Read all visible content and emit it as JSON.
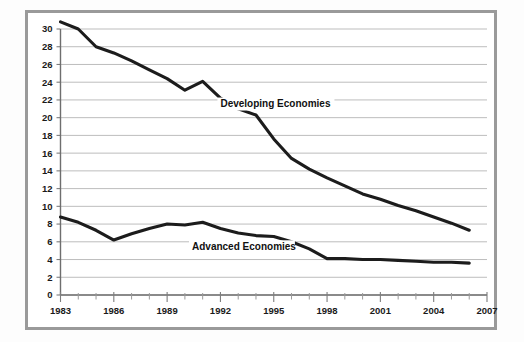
{
  "figure": {
    "background_color": "#ffffff",
    "frame_color": "#9a9a9a",
    "line_color": "#1c1c1c",
    "grid_color": "#bdbdbd"
  },
  "chart_data": {
    "type": "line",
    "title": "",
    "subtitle": "",
    "xlabel": "",
    "ylabel": "",
    "xlim": [
      1983,
      2007
    ],
    "ylim": [
      0,
      30
    ],
    "grid": "horizontal",
    "legend_position": "inline-annotations",
    "x_tick_step": 1,
    "x_label_step": 3,
    "y_tick_step": 2,
    "xticklabels": [
      "1983",
      "1986",
      "1989",
      "1992",
      "1995",
      "1998",
      "2001",
      "2004",
      "2007"
    ],
    "yticklabels": [
      "0",
      "2",
      "4",
      "6",
      "8",
      "10",
      "12",
      "14",
      "16",
      "18",
      "20",
      "22",
      "24",
      "26",
      "28",
      "30"
    ],
    "x": [
      1983,
      1984,
      1985,
      1986,
      1987,
      1988,
      1989,
      1990,
      1991,
      1992,
      1993,
      1994,
      1995,
      1996,
      1997,
      1998,
      1999,
      2000,
      2001,
      2002,
      2003,
      2004,
      2005,
      2006
    ],
    "series": [
      {
        "name": "Developing Economies",
        "label": "Developing Economies",
        "label_x": 1992.0,
        "label_y": 21.2,
        "values": [
          30.8,
          30.0,
          28.0,
          27.3,
          26.4,
          25.4,
          24.4,
          23.1,
          24.1,
          22.2,
          21.0,
          20.3,
          17.6,
          15.4,
          14.2,
          13.2,
          12.3,
          11.4,
          10.8,
          10.1,
          9.5,
          8.8,
          8.1,
          7.3
        ]
      },
      {
        "name": "Advanced Economies",
        "label": "Advanced Economies",
        "label_x": 1990.4,
        "label_y": 5.1,
        "values": [
          8.8,
          8.2,
          7.3,
          6.2,
          6.9,
          7.5,
          8.0,
          7.9,
          8.2,
          7.5,
          7.0,
          6.7,
          6.6,
          6.0,
          5.2,
          4.1,
          4.1,
          4.0,
          4.0,
          3.9,
          3.8,
          3.7,
          3.7,
          3.6
        ]
      }
    ],
    "annotations": [
      {
        "text": "Developing Economies",
        "x": 1992.0,
        "y": 21.2
      },
      {
        "text": "Advanced Economies",
        "x": 1990.4,
        "y": 5.1
      }
    ]
  }
}
